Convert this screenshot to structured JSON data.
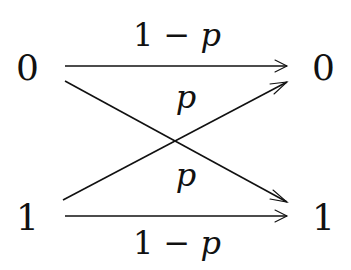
{
  "diagram": {
    "inputs": [
      {
        "id": "in0",
        "label": "0"
      },
      {
        "id": "in1",
        "label": "1"
      }
    ],
    "outputs": [
      {
        "id": "out0",
        "label": "0"
      },
      {
        "id": "out1",
        "label": "1"
      }
    ],
    "edges": [
      {
        "from": "in0",
        "to": "out0",
        "label_num": "1 − ",
        "label_var": "p"
      },
      {
        "from": "in0",
        "to": "out1",
        "label_num": "",
        "label_var": "p"
      },
      {
        "from": "in1",
        "to": "out0",
        "label_num": "",
        "label_var": "p"
      },
      {
        "from": "in1",
        "to": "out1",
        "label_num": "1 − ",
        "label_var": "p"
      }
    ],
    "colors": {
      "ink": "#111111",
      "background": "#ffffff"
    }
  }
}
